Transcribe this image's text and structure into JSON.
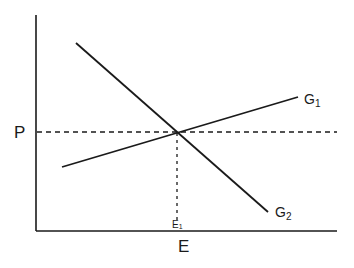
{
  "diagram": {
    "axes": {
      "y_label": "P",
      "x_label": "E"
    },
    "curves": [
      {
        "name": "G1",
        "label_main": "G",
        "label_sub": "1",
        "from": [
          62,
          167
        ],
        "to": [
          298,
          97
        ]
      },
      {
        "name": "G2",
        "label_main": "G",
        "label_sub": "2",
        "from": [
          76,
          43
        ],
        "to": [
          268,
          212
        ]
      }
    ],
    "equilibrium": {
      "point_label_main": "E",
      "point_label_sub": "1",
      "x": 177,
      "y": 132
    },
    "colors": {
      "line": "#1a1a1a",
      "background": "#ffffff"
    }
  }
}
